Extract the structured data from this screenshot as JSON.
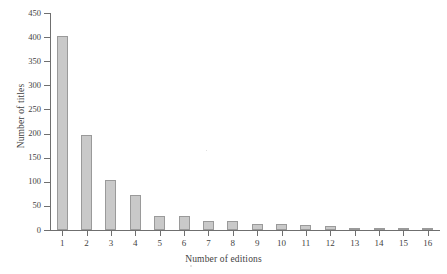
{
  "chart_data": {
    "type": "bar",
    "title": "",
    "xlabel": "Number of editions",
    "ylabel": "Number of titles",
    "categories": [
      "1",
      "2",
      "3",
      "4",
      "5",
      "6",
      "7",
      "8",
      "9",
      "10",
      "11",
      "12",
      "13",
      "14",
      "15",
      "16"
    ],
    "values": [
      403,
      197,
      104,
      72,
      29,
      29,
      19,
      19,
      12,
      12,
      11,
      9,
      1,
      3,
      1,
      3
    ],
    "ylim": [
      0,
      450
    ],
    "ytick_labels": [
      "0",
      "50",
      "100",
      "150",
      "200",
      "250",
      "300",
      "350",
      "400",
      "450"
    ],
    "ytick_values": [
      0,
      50,
      100,
      150,
      200,
      250,
      300,
      350,
      400,
      450
    ],
    "xtick_labels": [
      "1",
      "2",
      "3",
      "4",
      "5",
      "6",
      "7",
      "8",
      "9",
      "10",
      "11",
      "12",
      "13",
      "14",
      "15",
      "16"
    ],
    "grid": false,
    "legend": null,
    "bar_color": "#c9c9c9",
    "bar_edge_color": "#9a9a9a",
    "axis_color": "#6f6f6f",
    "background": "#ffffff"
  }
}
